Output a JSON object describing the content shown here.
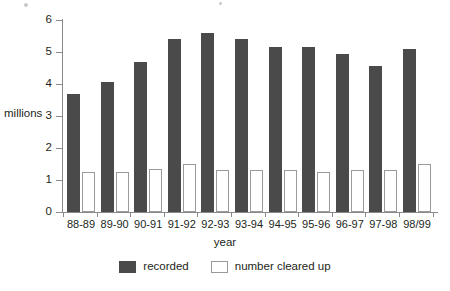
{
  "chart_data": {
    "type": "bar",
    "title": "",
    "xlabel": "year",
    "ylabel": "millions",
    "ylim": [
      0,
      6
    ],
    "ytick_labels": [
      "6",
      "5",
      "4",
      "3",
      "2",
      "1",
      "0"
    ],
    "ytick_values": [
      6,
      5,
      4,
      3,
      2,
      1,
      0
    ],
    "grid": false,
    "legend_position": "bottom-center",
    "categories": [
      "88-89",
      "89-90",
      "90-91",
      "91-92",
      "92-93",
      "93-94",
      "94-95",
      "95-96",
      "96-97",
      "97-98",
      "98/99"
    ],
    "series": [
      {
        "name": "recorded",
        "color": "#4a4a4a",
        "values": [
          3.7,
          4.05,
          4.7,
          5.4,
          5.6,
          5.4,
          5.15,
          5.15,
          4.95,
          4.55,
          5.1
        ]
      },
      {
        "name": "number cleared up",
        "color": "#ffffff",
        "values": [
          1.25,
          1.25,
          1.35,
          1.5,
          1.3,
          1.3,
          1.3,
          1.25,
          1.3,
          1.3,
          1.5
        ]
      }
    ]
  },
  "legend": {
    "items": [
      {
        "label": "recorded",
        "swatch": "filled-dark-square"
      },
      {
        "label": "number cleared up",
        "swatch": "outlined-white-square"
      }
    ]
  },
  "colors": {
    "bar_recorded": "#4a4a4a",
    "bar_cleared_fill": "#ffffff",
    "bar_cleared_border": "#9a9a9a",
    "axis": "#8a8a8a",
    "text": "#231f20"
  }
}
